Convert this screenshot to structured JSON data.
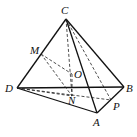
{
  "diagram": {
    "points": {
      "C": {
        "label": "C",
        "x": 66,
        "y": 19,
        "lx": 61,
        "ly": 14
      },
      "D": {
        "label": "D",
        "x": 17,
        "y": 88,
        "lx": 5,
        "ly": 92
      },
      "B": {
        "label": "B",
        "x": 124,
        "y": 87,
        "lx": 126,
        "ly": 92
      },
      "A": {
        "label": "A",
        "x": 97,
        "y": 113,
        "lx": 93,
        "ly": 126
      },
      "M": {
        "label": "M",
        "x": 41,
        "y": 54,
        "lx": 30,
        "ly": 54
      },
      "O": {
        "label": "O",
        "x": 72,
        "y": 74,
        "lx": 74,
        "ly": 78
      },
      "N": {
        "label": "N",
        "x": 72,
        "y": 96,
        "lx": 68,
        "ly": 104
      },
      "P": {
        "label": "P",
        "x": 111,
        "y": 100,
        "lx": 113,
        "ly": 110
      }
    },
    "solid_edges": [
      [
        "C",
        "D"
      ],
      [
        "C",
        "B"
      ],
      [
        "C",
        "A"
      ],
      [
        "D",
        "B"
      ],
      [
        "D",
        "A"
      ],
      [
        "A",
        "B"
      ]
    ],
    "dashed_edges": [
      [
        "C",
        "P"
      ],
      [
        "M",
        "O"
      ],
      [
        "M",
        "N"
      ],
      [
        "O",
        "N"
      ],
      [
        "D",
        "N"
      ],
      [
        "D",
        "P"
      ],
      [
        "C",
        "N"
      ]
    ],
    "colors": {
      "line": "#111111",
      "background": "#ffffff"
    }
  }
}
